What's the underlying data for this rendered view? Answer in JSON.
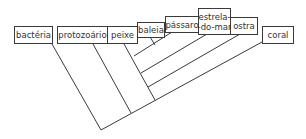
{
  "diagram": {
    "type": "cladogram",
    "line_color": "#3a3a3a",
    "taxa": [
      {
        "id": "bacteria",
        "label": "bactéria"
      },
      {
        "id": "protozoario",
        "label": "protozoário"
      },
      {
        "id": "peixe",
        "label": "peixe"
      },
      {
        "id": "baleia",
        "label": "baleia"
      },
      {
        "id": "passaro",
        "label": "pássaro"
      },
      {
        "id": "estrela",
        "label": "estrela-\n-do-mar"
      },
      {
        "id": "ostra",
        "label": "ostra"
      },
      {
        "id": "coral",
        "label": "coral"
      }
    ]
  }
}
